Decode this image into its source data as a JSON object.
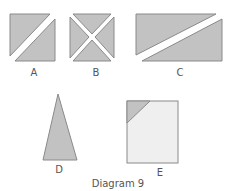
{
  "diagram": {
    "caption": "Diagram 9",
    "colors": {
      "fill_dark": "#c2c2c2",
      "fill_light": "#efefef",
      "stroke": "#8a8a8a",
      "gap": "#ffffff"
    },
    "shapes": [
      {
        "id": "A",
        "label": "A",
        "type": "square-cut-by-one-diagonal-strip"
      },
      {
        "id": "B",
        "label": "B",
        "type": "square-cut-by-two-diagonal-strips"
      },
      {
        "id": "C",
        "label": "C",
        "type": "rectangle-cut-by-one-diagonal-strip"
      },
      {
        "id": "D",
        "label": "D",
        "type": "isosceles-triangle"
      },
      {
        "id": "E",
        "label": "E",
        "type": "square-with-shaded-corner-triangle"
      }
    ]
  }
}
